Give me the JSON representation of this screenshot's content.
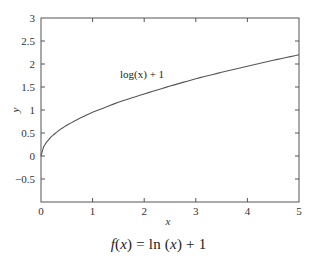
{
  "chart_data": {
    "type": "line",
    "title": "",
    "caption": "f(x) = ln (x) + 1",
    "caption_parts": {
      "f": "f",
      "open1": "(",
      "x1": "x",
      "close1": ")",
      "rest1": " = ln (",
      "x2": "x",
      "rest2": ") + 1"
    },
    "xlabel": "x",
    "ylabel": "y",
    "xlim": [
      0,
      5
    ],
    "ylim": [
      -1,
      3
    ],
    "grid": false,
    "legend": null,
    "x_ticks": [
      0,
      1,
      2,
      3,
      4,
      5
    ],
    "x_tick_labels": [
      "0",
      "1",
      "2",
      "3",
      "4",
      "5"
    ],
    "y_ticks": [
      -0.5,
      0,
      0.5,
      1,
      1.5,
      2,
      2.5,
      3
    ],
    "y_tick_labels": [
      "−0.5",
      "0",
      "0.5",
      "1",
      "1.5",
      "2",
      "2.5",
      "3"
    ],
    "annotations": [
      {
        "text": "log(x) + 1",
        "x": 1.55,
        "y": 1.7
      }
    ],
    "series": [
      {
        "name": "log(x) + 1",
        "color": "#555555",
        "x": [
          0,
          0.05,
          0.1,
          0.2,
          0.35,
          0.5,
          0.75,
          1,
          1.5,
          2,
          2.5,
          3,
          3.5,
          4,
          4.5,
          5
        ],
        "y": [
          0,
          0.2,
          0.29,
          0.42,
          0.56,
          0.67,
          0.82,
          0.95,
          1.17,
          1.35,
          1.52,
          1.68,
          1.82,
          1.95,
          2.08,
          2.2
        ]
      }
    ]
  },
  "colors": {
    "axis": "#555555",
    "curve": "#555555",
    "text": "#222222",
    "background": "#ffffff"
  }
}
